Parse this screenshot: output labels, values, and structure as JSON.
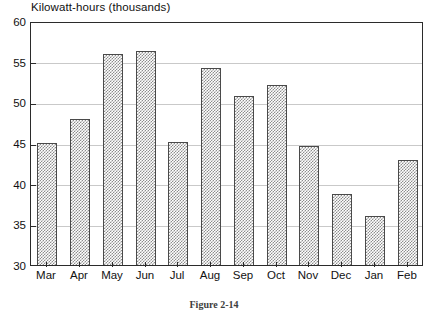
{
  "figure": {
    "caption": "Figure 2-14"
  },
  "chart_data": {
    "type": "bar",
    "title": "Kilowatt-hours (thousands)",
    "xlabel": "",
    "ylabel": "",
    "ylim": [
      30,
      60
    ],
    "yticks": [
      30,
      35,
      40,
      45,
      50,
      55,
      60
    ],
    "ytick_labels": [
      "30",
      "35",
      "40",
      "45",
      "50",
      "55",
      "60"
    ],
    "grid": true,
    "grid_axis": "y",
    "legend": false,
    "bar_fill": "crosshatch",
    "bar_fill_color": "#8d8d8d",
    "bar_edge_color": "#4a4a4a",
    "categories": [
      "Mar",
      "Apr",
      "May",
      "Jun",
      "Jul",
      "Aug",
      "Sep",
      "Oct",
      "Nov",
      "Dec",
      "Jan",
      "Feb"
    ],
    "values": [
      45.0,
      48.0,
      56.0,
      56.3,
      45.1,
      54.2,
      50.8,
      52.1,
      44.6,
      38.7,
      36.0,
      42.9
    ]
  }
}
